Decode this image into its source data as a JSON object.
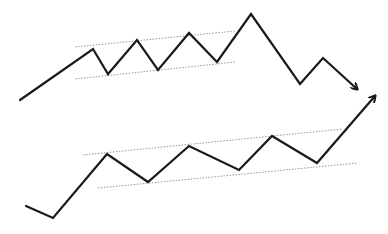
{
  "figure": {
    "header_faint_text": "",
    "colors": {
      "background": "#ffffff",
      "price_line": "#1a1a1a",
      "channel_line": "#8a8a8a"
    }
  },
  "patterns": [
    {
      "name": "upper-pattern",
      "description": "Rising channel followed by breakdown",
      "price_path": [
        [
          20,
          100
        ],
        [
          93,
          49
        ],
        [
          108,
          74
        ],
        [
          137,
          40
        ],
        [
          158,
          70
        ],
        [
          189,
          33
        ],
        [
          217,
          62
        ],
        [
          251,
          14
        ],
        [
          300,
          84
        ],
        [
          323,
          58
        ],
        [
          357,
          89
        ]
      ],
      "arrow_direction": "down-right",
      "channel_upper": [
        [
          75,
          47
        ],
        [
          235,
          31
        ]
      ],
      "channel_lower": [
        [
          75,
          79
        ],
        [
          235,
          62
        ]
      ]
    },
    {
      "name": "lower-pattern",
      "description": "Rising channel followed by breakout",
      "price_path": [
        [
          26,
          206
        ],
        [
          53,
          218
        ],
        [
          107,
          154
        ],
        [
          148,
          182
        ],
        [
          189,
          146
        ],
        [
          239,
          170
        ],
        [
          272,
          136
        ],
        [
          317,
          163
        ],
        [
          375,
          96
        ]
      ],
      "arrow_direction": "up-right",
      "channel_upper": [
        [
          83,
          155
        ],
        [
          343,
          129
        ]
      ],
      "channel_lower": [
        [
          98,
          188
        ],
        [
          358,
          163
        ]
      ]
    }
  ]
}
